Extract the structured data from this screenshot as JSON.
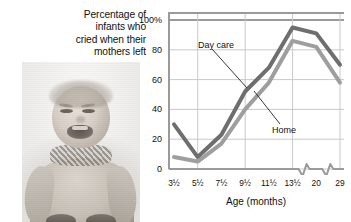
{
  "figure": {
    "title_lines": [
      "Percentage of",
      "infants who",
      "cried when their",
      "mothers left"
    ],
    "photo_alt": "crying-infant-photograph"
  },
  "chart_data": {
    "type": "line",
    "title": "Percentage of infants who cried when their mothers left",
    "xlabel": "Age (months)",
    "ylabel": "",
    "categories": [
      "3½",
      "5½",
      "7½",
      "9½",
      "11½",
      "13½",
      "20",
      "29"
    ],
    "ytick_labels": [
      "0",
      "20",
      "40",
      "60",
      "80",
      "100%"
    ],
    "ytick_values": [
      0,
      20,
      40,
      60,
      80,
      100
    ],
    "ylim": [
      0,
      100
    ],
    "grid": true,
    "legend": "inline-annotations",
    "axis_break": true,
    "axis_break_after": [
      "13½",
      "20"
    ],
    "series": [
      {
        "name": "Day care",
        "color": "#6e6e6e",
        "values": [
          30,
          8,
          23,
          52,
          68,
          95,
          91,
          70
        ]
      },
      {
        "name": "Home",
        "color": "#9e9e9e",
        "values": [
          8,
          5,
          17,
          40,
          58,
          86,
          82,
          58
        ]
      }
    ],
    "annotations": [
      {
        "label": "Day care",
        "target_series": "Day care"
      },
      {
        "label": "Home",
        "target_series": "Home"
      }
    ]
  },
  "colors": {
    "day_care": "#6e6e6e",
    "home": "#9e9e9e",
    "grid": "#c9c9c9",
    "frame": "#9a9a9a",
    "text": "#111111"
  }
}
